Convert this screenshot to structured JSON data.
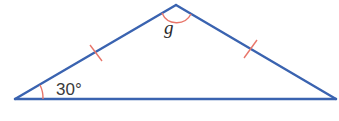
{
  "diagram": {
    "type": "isosceles-triangle",
    "vertices": [
      "left-base",
      "apex",
      "right-base"
    ],
    "equal_sides": [
      "left-side",
      "right-side"
    ],
    "base_angle_label": "30°",
    "apex_angle_label": "g",
    "colors": {
      "sides": "#3a63b0",
      "marks": "#e8766a",
      "text": "#3a3a3a"
    }
  }
}
